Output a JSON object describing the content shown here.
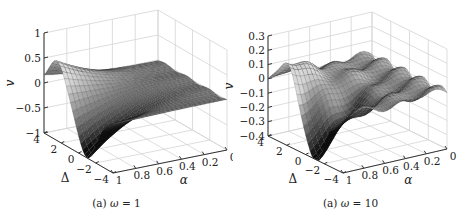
{
  "chart_data": [
    {
      "type": "surface",
      "caption_prefix": "(a)",
      "caption_var": "ω",
      "caption_eq": " = 1",
      "xlabel": "α",
      "ylabel": "Δ",
      "zlabel": "v",
      "x_ticks": [
        "1",
        "0.8",
        "0.6",
        "0.4",
        "0.2",
        "0"
      ],
      "x_range": [
        0,
        1
      ],
      "y_ticks": [
        "4",
        "2",
        "0",
        "−2",
        "−4"
      ],
      "y_range": [
        -4,
        4
      ],
      "z_ticks": [
        "1",
        "0.5",
        "0",
        "−0.5",
        "−1"
      ],
      "z_range": [
        -1,
        1
      ],
      "grid": true,
      "colormap": "gray",
      "description": "Surface with sharp peak (~0.6) near α=1, Δ≈2.5 and deep trough (~-1) near α=1, Δ≈-1; flat near 0 for small α",
      "peak": {
        "alpha": 1.0,
        "delta": 2.5,
        "v": 0.6
      },
      "trough": {
        "alpha": 1.0,
        "delta": -1.0,
        "v": -1.0
      },
      "geom": {
        "x0": 44,
        "zTop": 33,
        "zBot": 133,
        "back": [
          158,
          10
        ],
        "right": [
          228,
          48
        ],
        "front": [
          113,
          173
        ],
        "rightBot": [
          228,
          147
        ]
      }
    },
    {
      "type": "surface",
      "caption_prefix": "(a)",
      "caption_var": "ω",
      "caption_eq": " = 10",
      "xlabel": "α",
      "ylabel": "Δ",
      "zlabel": "v",
      "x_ticks": [
        "1",
        "0.8",
        "0.6",
        "0.4",
        "0.2",
        "0"
      ],
      "x_range": [
        0,
        1
      ],
      "y_ticks": [
        "4",
        "2",
        "0",
        "−2",
        "−4"
      ],
      "y_range": [
        -4,
        4
      ],
      "z_ticks": [
        "0.3",
        "0.2",
        "0.1",
        "0",
        "−0.1",
        "−0.2",
        "−0.3",
        "−0.4"
      ],
      "z_range": [
        -0.4,
        0.3
      ],
      "grid": true,
      "colormap": "gray",
      "description": "Surface with peak (~0.2) near α=1, Δ≈2 and trough (~-0.4) near α=1, Δ≈-1; wavy ripples near 0 for small α",
      "peak": {
        "alpha": 1.0,
        "delta": 2.0,
        "v": 0.2
      },
      "trough": {
        "alpha": 1.0,
        "delta": -1.0,
        "v": -0.4
      },
      "geom": {
        "x0": 268,
        "zTop": 36,
        "zBot": 136,
        "back": [
          372,
          12
        ],
        "right": [
          448,
          48
        ],
        "front": [
          343,
          173
        ],
        "rightBot": [
          448,
          147
        ]
      }
    }
  ]
}
